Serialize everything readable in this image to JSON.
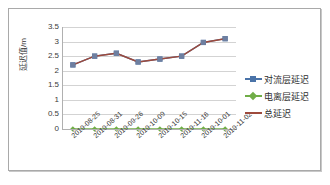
{
  "chart_data": {
    "type": "line",
    "title": "",
    "xlabel": "",
    "ylabel": "延迟值/m",
    "ylim": [
      0,
      3.5
    ],
    "yticks": [
      "0",
      "0.5",
      "1",
      "1.5",
      "2",
      "2.5",
      "3",
      "3.5"
    ],
    "ytick_values": [
      0,
      0.5,
      1,
      1.5,
      2,
      2.5,
      3,
      3.5
    ],
    "grid": true,
    "legend_position": "right",
    "categories": [
      "2019-08-25",
      "2019-08-31",
      "2019-09-26",
      "2019-10-09",
      "2019-10-15",
      "2019-11-16",
      "2019-10-01",
      "2019-11-02"
    ],
    "series": [
      {
        "name": "对流层延迟",
        "color": "#4A73A8",
        "marker": "square",
        "values": [
          2.2,
          2.5,
          2.6,
          2.3,
          2.4,
          2.5,
          2.97,
          3.1
        ]
      },
      {
        "name": "电离层延迟",
        "color": "#70AD47",
        "marker": "diamond",
        "values": [
          0,
          0,
          0,
          0,
          0,
          0,
          0,
          0
        ]
      },
      {
        "name": "总延迟",
        "color": "#9E4A3C",
        "marker": "line",
        "values": [
          2.2,
          2.5,
          2.6,
          2.3,
          2.4,
          2.5,
          2.97,
          3.1
        ]
      }
    ]
  },
  "legend": {
    "items": [
      {
        "label": "对流层延迟"
      },
      {
        "label": "电离层延迟"
      },
      {
        "label": "总延迟"
      }
    ]
  },
  "axes": {
    "y_axis_title": "延迟值/m"
  }
}
